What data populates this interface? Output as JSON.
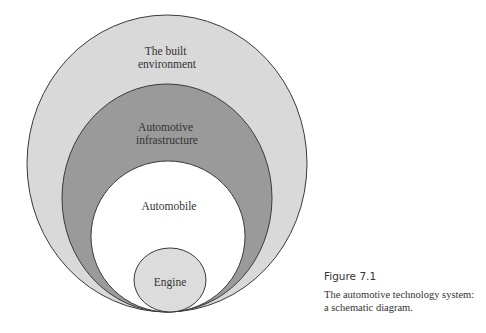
{
  "diagram": {
    "type": "nested-ellipses",
    "layers": [
      {
        "id": "built-environment",
        "label_lines": [
          "The built",
          "environment"
        ],
        "fill": "#d9d9d9"
      },
      {
        "id": "automotive-infrastructure",
        "label_lines": [
          "Automotive",
          "infrastructure"
        ],
        "fill": "#9a9a9a"
      },
      {
        "id": "automobile",
        "label_lines": [
          "Automobile"
        ],
        "fill": "#ffffff"
      },
      {
        "id": "engine",
        "label_lines": [
          "Engine"
        ],
        "fill": "#dcdcdc"
      }
    ],
    "stroke": "#3a3a3a"
  },
  "caption": {
    "figure_number": "Figure 7.1",
    "text_line1": "The automotive technology system:",
    "text_line2": "a schematic diagram."
  }
}
